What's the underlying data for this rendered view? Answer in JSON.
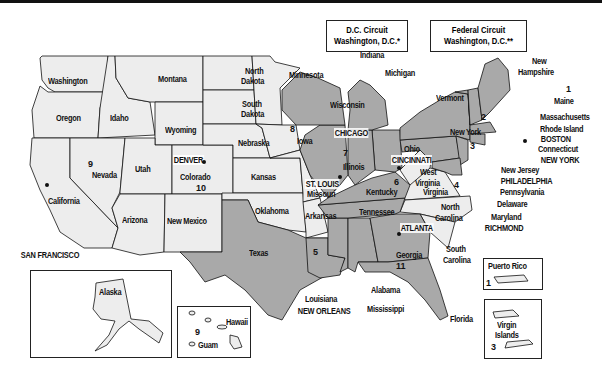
{
  "title_boxes": [
    {
      "line1": "D.C. Circuit",
      "line2": "Washington, D.C.*"
    },
    {
      "line1": "Federal Circuit",
      "line2": "Washington, D.C.**"
    }
  ],
  "states": {
    "washington": "Washington",
    "oregon": "Oregon",
    "california": "California",
    "idaho": "Idaho",
    "nevada": "Nevada",
    "montana": "Montana",
    "wyoming": "Wyoming",
    "utah": "Utah",
    "arizona": "Arizona",
    "colorado": "Colorado",
    "new_mexico": "New Mexico",
    "north_dakota_1": "North",
    "north_dakota_2": "Dakota",
    "south_dakota_1": "South",
    "south_dakota_2": "Dakota",
    "nebraska": "Nebraska",
    "kansas": "Kansas",
    "oklahoma": "Oklahoma",
    "texas": "Texas",
    "minnesota": "Minnesota",
    "iowa": "Iowa",
    "missouri": "Missouri",
    "arkansas": "Arkansas",
    "louisiana": "Louisiana",
    "wisconsin": "Wisconsin",
    "illinois": "Illinois",
    "indiana": "Indiana",
    "michigan": "Michigan",
    "ohio": "Ohio",
    "kentucky": "Kentucky",
    "tennessee": "Tennessee",
    "mississippi": "Mississippi",
    "alabama": "Alabama",
    "georgia": "Georgia",
    "florida": "Florida",
    "south_carolina_1": "South",
    "south_carolina_2": "Carolina",
    "north_carolina_1": "North",
    "north_carolina_2": "Carolina",
    "virginia": "Virginia",
    "west_virginia_1": "West",
    "west_virginia_2": "Virginia",
    "maryland": "Maryland",
    "delaware": "Delaware",
    "pennsylvania": "Pennsylvania",
    "new_jersey": "New Jersey",
    "new_york": "New York",
    "connecticut": "Connecticut",
    "rhode_island": "Rhode Island",
    "massachusetts": "Massachusetts",
    "vermont": "Vermont",
    "new_hampshire_1": "New",
    "new_hampshire_2": "Hampshire",
    "maine": "Maine",
    "alaska": "Alaska",
    "hawaii": "Hawaii",
    "guam": "Guam",
    "puerto_rico": "Puerto Rico",
    "virgin_islands_1": "Virgin",
    "virgin_islands_2": "Islands"
  },
  "cities": {
    "san_francisco": "SAN FRANCISCO",
    "denver": "DENVER",
    "st_louis": "ST. LOUIS",
    "chicago": "CHICAGO",
    "cincinnati": "CINCINNATI",
    "new_orleans": "NEW ORLEANS",
    "atlanta": "ATLANTA",
    "richmond": "RICHMOND",
    "philadelphia": "PHILADELPHIA",
    "new_york": "NEW YORK",
    "boston": "BOSTON"
  },
  "circuits": {
    "c1": "1",
    "c1_pr": "1",
    "c2": "2",
    "c3": "3",
    "c3_vi": "3",
    "c4": "4",
    "c5": "5",
    "c6": "6",
    "c7": "7",
    "c8": "8",
    "c9": "9",
    "c9_hi": "9",
    "c10": "10",
    "c11": "11"
  },
  "colors": {
    "light_region": "#ededed",
    "dark_region": "#a9a9a9",
    "border": "#111111"
  }
}
